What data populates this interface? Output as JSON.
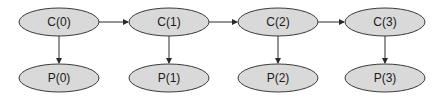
{
  "diagram": {
    "type": "directed-graph",
    "colors": {
      "node_fill": "#d9d9d9",
      "node_stroke": "#3a3a3a",
      "edge": "#2a2a2a",
      "background": "#ffffff"
    },
    "nodes": [
      {
        "id": "c0",
        "label": "C(0)",
        "cx": 59,
        "cy": 22
      },
      {
        "id": "c1",
        "label": "C(1)",
        "cx": 169,
        "cy": 22
      },
      {
        "id": "c2",
        "label": "C(2)",
        "cx": 278,
        "cy": 22
      },
      {
        "id": "c3",
        "label": "C(3)",
        "cx": 385,
        "cy": 22
      },
      {
        "id": "p0",
        "label": "P(0)",
        "cx": 59,
        "cy": 78
      },
      {
        "id": "p1",
        "label": "P(1)",
        "cx": 169,
        "cy": 78
      },
      {
        "id": "p2",
        "label": "P(2)",
        "cx": 278,
        "cy": 78
      },
      {
        "id": "p3",
        "label": "P(3)",
        "cx": 385,
        "cy": 78
      }
    ],
    "edges": [
      {
        "from": "C(0)",
        "to": "C(1)"
      },
      {
        "from": "C(1)",
        "to": "C(2)"
      },
      {
        "from": "C(2)",
        "to": "C(3)"
      },
      {
        "from": "C(0)",
        "to": "P(0)"
      },
      {
        "from": "C(1)",
        "to": "P(1)"
      },
      {
        "from": "C(2)",
        "to": "P(2)"
      },
      {
        "from": "C(3)",
        "to": "P(3)"
      }
    ]
  }
}
